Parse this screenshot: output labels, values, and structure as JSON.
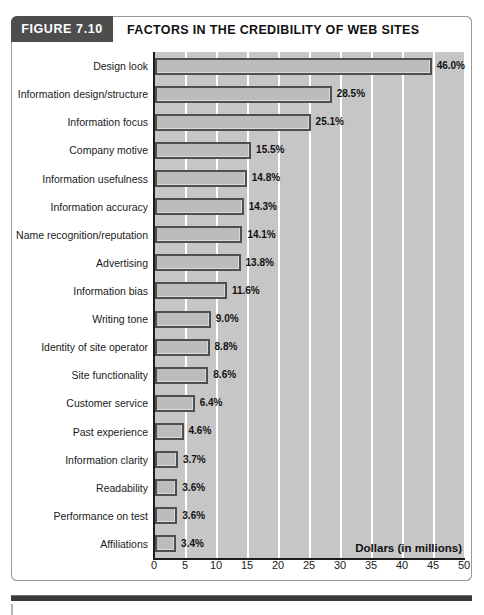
{
  "figure": {
    "number_label": "FIGURE 7.10",
    "title": "FACTORS IN THE CREDIBILITY OF WEB SITES"
  },
  "colors": {
    "header_block": "#4d4d4d",
    "plot_background": "#c6c6c6",
    "bar_fill": "#bcbcbc",
    "bar_border": "#4f4f4f",
    "gridline": "#ffffff",
    "axis": "#1d1d1d"
  },
  "chart_data": {
    "type": "bar",
    "orientation": "horizontal",
    "title": "FACTORS IN THE CREDIBILITY OF WEB SITES",
    "xlabel": "Dollars (in millions)",
    "ylabel": "",
    "xlim": [
      0,
      50
    ],
    "xticks": [
      0,
      5,
      10,
      15,
      20,
      25,
      30,
      35,
      40,
      45,
      50
    ],
    "xtick_labels": [
      "0",
      "5",
      "10",
      "15",
      "20",
      "25",
      "30",
      "35",
      "40",
      "45",
      "50"
    ],
    "grid": true,
    "grid_axis": "x",
    "legend": false,
    "categories": [
      "Design look",
      "Information design/structure",
      "Information focus",
      "Company motive",
      "Information usefulness",
      "Information accuracy",
      "Name recognition/reputation",
      "Advertising",
      "Information bias",
      "Writing tone",
      "Identity of site operator",
      "Site functionality",
      "Customer service",
      "Past experience",
      "Information clarity",
      "Readability",
      "Performance on test",
      "Affiliations"
    ],
    "values": [
      46.0,
      28.5,
      25.1,
      15.5,
      14.8,
      14.3,
      14.1,
      13.8,
      11.6,
      9.0,
      8.8,
      8.6,
      6.4,
      4.6,
      3.7,
      3.6,
      3.6,
      3.4
    ],
    "data_labels": [
      "46.0%",
      "28.5%",
      "25.1%",
      "15.5%",
      "14.8%",
      "14.3%",
      "14.1%",
      "13.8%",
      "11.6%",
      "9.0%",
      "8.8%",
      "8.6%",
      "6.4%",
      "4.6%",
      "3.7%",
      "3.6%",
      "3.6%",
      "3.4%"
    ]
  }
}
